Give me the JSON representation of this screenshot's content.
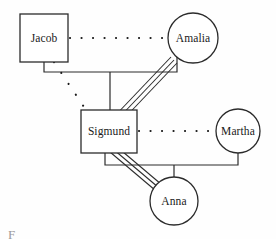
{
  "diagram": {
    "type": "genogram",
    "caption_fragment": "F",
    "canvas": {
      "width": 276,
      "height": 239
    },
    "colors": {
      "background": "#fefefe",
      "stroke": "#2b2b2b",
      "text": "#1a1a1a",
      "caption": "#9a9a9a"
    },
    "nodes": [
      {
        "id": "jacob",
        "label": "Jacob",
        "shape": "square",
        "gender": "male",
        "x": 20,
        "y": 14,
        "w": 48,
        "h": 48,
        "cx": 44,
        "cy": 38
      },
      {
        "id": "amalia",
        "label": "Amalia",
        "shape": "circle",
        "gender": "female",
        "cx": 193,
        "cy": 38,
        "r": 25
      },
      {
        "id": "sigmund",
        "label": "Sigmund",
        "shape": "square",
        "gender": "male",
        "x": 81,
        "y": 110,
        "w": 56,
        "h": 43,
        "cx": 109,
        "cy": 131
      },
      {
        "id": "martha",
        "label": "Martha",
        "shape": "circle",
        "gender": "female",
        "cx": 238,
        "cy": 131,
        "r": 22
      },
      {
        "id": "anna",
        "label": "Anna",
        "shape": "circle",
        "gender": "female",
        "cx": 174,
        "cy": 201,
        "r": 24
      }
    ],
    "links": [
      {
        "id": "jacob-amalia",
        "from": "jacob",
        "to": "amalia",
        "style": "dotted",
        "relation": "marriage-distant",
        "path": "M 70 38 L 167 38"
      },
      {
        "id": "jacob-sigmund",
        "from": "jacob",
        "to": "sigmund",
        "style": "dotted",
        "relation": "parent-child-distant",
        "path": "M 54 62 L 86 110"
      },
      {
        "id": "amalia-sigmund",
        "from": "amalia",
        "to": "sigmund",
        "style": "triple",
        "relation": "parent-child-enmeshed",
        "paths": [
          "M 171 57 L 111 120",
          "M 174 60 L 114 123",
          "M 177 63 L 117 126"
        ]
      },
      {
        "id": "sigmund-martha",
        "from": "sigmund",
        "to": "martha",
        "style": "dotted",
        "relation": "marriage-distant",
        "path": "M 139 131 L 215 131"
      },
      {
        "id": "sigmund-anna",
        "from": "sigmund",
        "to": "anna",
        "style": "triple",
        "relation": "parent-child-enmeshed",
        "paths": [
          "M 110 152 L 162 196",
          "M 113 149 L 165 193",
          "M 116 146 L 168 190"
        ]
      },
      {
        "id": "parent-bar-top",
        "style": "solid",
        "relation": "sibship-bar",
        "path": "M 44 62 L 44 72 L 177 72 L 177 57 M 110 72 L 110 110"
      },
      {
        "id": "parent-bar-bottom",
        "style": "solid",
        "relation": "sibship-bar",
        "path": "M 105 153 L 105 165 L 238 165 L 238 153 M 174 165 L 174 177"
      }
    ]
  }
}
